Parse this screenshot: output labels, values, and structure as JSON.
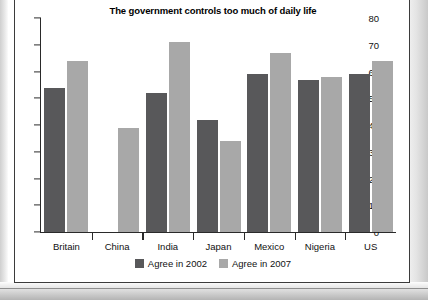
{
  "chart_data": {
    "type": "bar",
    "title": "The government controls too much of daily life",
    "xlabel": "",
    "ylabel": "",
    "ylim": [
      0,
      80
    ],
    "yticks": [
      0,
      10,
      20,
      30,
      40,
      50,
      60,
      70,
      80
    ],
    "grid": false,
    "legend_position": "bottom",
    "categories": [
      "Britain",
      "China",
      "India",
      "Japan",
      "Mexico",
      "Nigeria",
      "US"
    ],
    "series": [
      {
        "name": "Agree in 2002",
        "color": "#58585a",
        "values": [
          54,
          null,
          52,
          42,
          59,
          57,
          59
        ]
      },
      {
        "name": "Agree in 2007",
        "color": "#a8a8a8",
        "values": [
          64,
          39,
          71,
          34,
          67,
          58,
          64
        ]
      }
    ]
  }
}
